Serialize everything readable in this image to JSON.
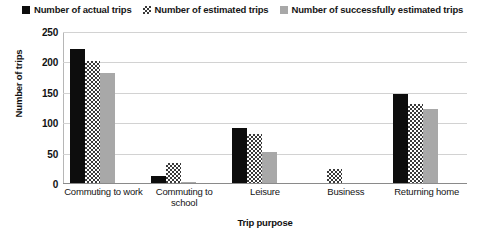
{
  "chart_data": {
    "type": "bar",
    "title": "",
    "xlabel": "Trip purpose",
    "ylabel": "Number of trips",
    "ylim": [
      0,
      250
    ],
    "yticks": [
      0,
      50,
      100,
      150,
      200,
      250
    ],
    "grid": "horizontal",
    "legend_position": "top",
    "categories": [
      "Commuting to work",
      "Commuting to school",
      "Leisure",
      "Business",
      "Returning home"
    ],
    "series": [
      {
        "name": "Number of actual trips",
        "color": "#0d0d0d",
        "pattern": "solid",
        "values": [
          222,
          14,
          92,
          0,
          148
        ]
      },
      {
        "name": "Number of estimated trips",
        "color": "#3a3a3a",
        "pattern": "checkered",
        "values": [
          202,
          35,
          82,
          25,
          132
        ]
      },
      {
        "name": "Number of successfully estimated trips",
        "color": "#a8a8a8",
        "pattern": "solid",
        "values": [
          182,
          3,
          52,
          0,
          124
        ]
      }
    ]
  },
  "axis": {
    "y_tick_labels": [
      "250",
      "200",
      "150",
      "100",
      "50",
      "0"
    ]
  }
}
